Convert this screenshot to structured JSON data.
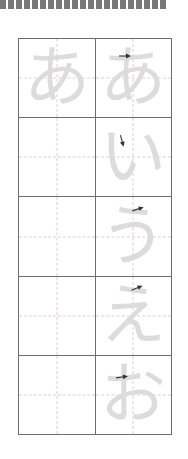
{
  "sheet": {
    "title": "Hiragana writing practice sheet",
    "script": "hiragana",
    "row_set": "a-row vowels",
    "columns": 2,
    "rows": 5,
    "colors": {
      "grid_line": "#6d6d6d",
      "guide_line": "#ddcfcf",
      "glyph": "#dcdcdc",
      "arrow": "#333333",
      "ruler_dash": "#777777",
      "page_background": "#ffffff"
    },
    "ruler": {
      "name": "dashed-ruler-strip",
      "dash_count": 21,
      "dash_label": ""
    },
    "rows_data": [
      {
        "index": 1,
        "romaji": "a",
        "cells": [
          {
            "glyph": "あ",
            "arrow": false,
            "arrow_x": 0,
            "arrow_y": 0,
            "arrow_rot": 0
          },
          {
            "glyph": "あ",
            "arrow": true,
            "arrow_x": 22,
            "arrow_y": 12,
            "arrow_rot": 0
          }
        ]
      },
      {
        "index": 2,
        "romaji": "i",
        "cells": [
          {
            "glyph": "",
            "arrow": false,
            "arrow_x": 0,
            "arrow_y": 0,
            "arrow_rot": 0
          },
          {
            "glyph": "い",
            "arrow": true,
            "arrow_x": 19,
            "arrow_y": 18,
            "arrow_rot": 75
          }
        ]
      },
      {
        "index": 3,
        "romaji": "u",
        "cells": [
          {
            "glyph": "",
            "arrow": false,
            "arrow_x": 0,
            "arrow_y": 0,
            "arrow_rot": 0
          },
          {
            "glyph": "う",
            "arrow": true,
            "arrow_x": 35,
            "arrow_y": 7,
            "arrow_rot": -18
          }
        ]
      },
      {
        "index": 4,
        "romaji": "e",
        "cells": [
          {
            "glyph": "",
            "arrow": false,
            "arrow_x": 0,
            "arrow_y": 0,
            "arrow_rot": 0
          },
          {
            "glyph": "え",
            "arrow": true,
            "arrow_x": 34,
            "arrow_y": 6,
            "arrow_rot": -22
          }
        ]
      },
      {
        "index": 5,
        "romaji": "o",
        "cells": [
          {
            "glyph": "",
            "arrow": false,
            "arrow_x": 0,
            "arrow_y": 0,
            "arrow_rot": 0
          },
          {
            "glyph": "お",
            "arrow": true,
            "arrow_x": 19,
            "arrow_y": 16,
            "arrow_rot": -8
          }
        ]
      }
    ]
  }
}
